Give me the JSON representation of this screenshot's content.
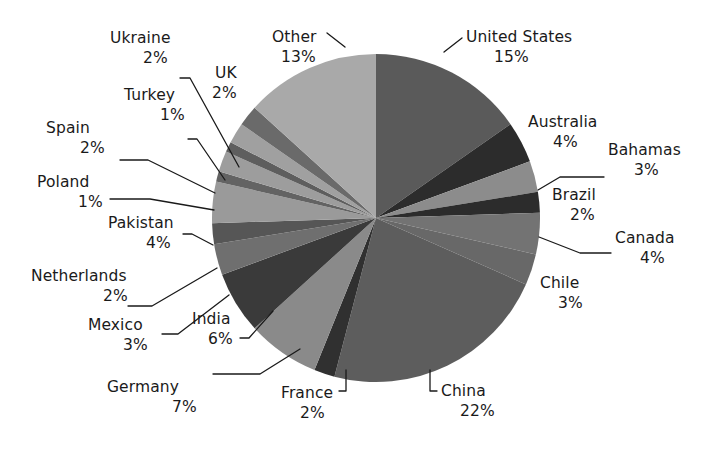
{
  "chart_data": {
    "type": "pie",
    "title": "",
    "subtitle": "",
    "xlabel": "",
    "ylabel": "",
    "legend_position": "labels-with-leader-lines",
    "grid": false,
    "value_unit": "%",
    "start_angle_deg": 0,
    "direction": "clockwise",
    "total_shown_percent": 98,
    "categories": [
      "United States",
      "Australia",
      "Bahamas",
      "Brazil",
      "Canada",
      "Chile",
      "China",
      "France",
      "Germany",
      "India",
      "Mexico",
      "Netherlands",
      "Pakistan",
      "Poland",
      "Spain",
      "Turkey",
      "Ukraine",
      "UK",
      "Other"
    ],
    "values": [
      15,
      4,
      3,
      2,
      4,
      3,
      22,
      2,
      7,
      6,
      3,
      2,
      4,
      1,
      2,
      1,
      2,
      2,
      13
    ],
    "slices": [
      {
        "label": "United States",
        "value": 15,
        "pct_text": "15%",
        "color": "#5a5a5a"
      },
      {
        "label": "Australia",
        "value": 4,
        "pct_text": "4%",
        "color": "#2c2c2c"
      },
      {
        "label": "Bahamas",
        "value": 3,
        "pct_text": "3%",
        "color": "#8c8c8c"
      },
      {
        "label": "Brazil",
        "value": 2,
        "pct_text": "2%",
        "color": "#2c2c2c"
      },
      {
        "label": "Canada",
        "value": 4,
        "pct_text": "4%",
        "color": "#737373"
      },
      {
        "label": "Chile",
        "value": 3,
        "pct_text": "3%",
        "color": "#686868"
      },
      {
        "label": "China",
        "value": 22,
        "pct_text": "22%",
        "color": "#5d5d5d"
      },
      {
        "label": "France",
        "value": 2,
        "pct_text": "2%",
        "color": "#303030"
      },
      {
        "label": "Germany",
        "value": 7,
        "pct_text": "7%",
        "color": "#8a8a8a"
      },
      {
        "label": "India",
        "value": 6,
        "pct_text": "6%",
        "color": "#3a3a3a"
      },
      {
        "label": "Mexico",
        "value": 3,
        "pct_text": "3%",
        "color": "#6f6f6f"
      },
      {
        "label": "Netherlands",
        "value": 2,
        "pct_text": "2%",
        "color": "#565656"
      },
      {
        "label": "Pakistan",
        "value": 4,
        "pct_text": "4%",
        "color": "#9a9a9a"
      },
      {
        "label": "Poland",
        "value": 1,
        "pct_text": "1%",
        "color": "#636363"
      },
      {
        "label": "Spain",
        "value": 2,
        "pct_text": "2%",
        "color": "#9d9d9d"
      },
      {
        "label": "Turkey",
        "value": 1,
        "pct_text": "1%",
        "color": "#5e5e5e"
      },
      {
        "label": "Ukraine",
        "value": 2,
        "pct_text": "2%",
        "color": "#a0a0a0"
      },
      {
        "label": "UK",
        "value": 2,
        "pct_text": "2%",
        "color": "#6a6a6a"
      },
      {
        "label": "Other",
        "value": 13,
        "pct_text": "13%",
        "color": "#a9a9a9"
      }
    ]
  },
  "geometry": {
    "cx": 376,
    "cy": 218,
    "r": 164
  },
  "labels": [
    {
      "name": "United States",
      "pct": "15%",
      "nx": 466,
      "ny": 42,
      "px": 494,
      "py": 62,
      "anchor": "start",
      "leader": "M 444 52 L 462 38"
    },
    {
      "name": "Australia",
      "pct": "4%",
      "nx": 528,
      "ny": 127,
      "px": 553,
      "py": 147,
      "anchor": "start",
      "leader": ""
    },
    {
      "name": "Bahamas",
      "pct": "3%",
      "nx": 608,
      "ny": 155,
      "px": 634,
      "py": 175,
      "anchor": "start",
      "leader": "M 538 190 L 560 177 L 604 177"
    },
    {
      "name": "Brazil",
      "pct": "2%",
      "nx": 552,
      "ny": 200,
      "px": 570,
      "py": 220,
      "anchor": "start",
      "leader": ""
    },
    {
      "name": "Canada",
      "pct": "4%",
      "nx": 615,
      "ny": 243,
      "px": 640,
      "py": 263,
      "anchor": "start",
      "leader": "M 539 237 L 580 253 L 611 253"
    },
    {
      "name": "Chile",
      "pct": "3%",
      "nx": 540,
      "ny": 288,
      "px": 558,
      "py": 308,
      "anchor": "start",
      "leader": ""
    },
    {
      "name": "China",
      "pct": "22%",
      "nx": 441,
      "ny": 396,
      "px": 460,
      "py": 416,
      "anchor": "start",
      "leader": "M 430 370 L 430 391 L 437 391"
    },
    {
      "name": "France",
      "pct": "2%",
      "nx": 281,
      "ny": 398,
      "px": 300,
      "py": 418,
      "anchor": "start",
      "leader": "M 346 370 L 346 391 L 339 391"
    },
    {
      "name": "Germany",
      "pct": "7%",
      "nx": 107,
      "ny": 392,
      "px": 172,
      "py": 412,
      "anchor": "start",
      "leader": "M 300 349 L 260 374 L 213 374"
    },
    {
      "name": "India",
      "pct": "6%",
      "nx": 192,
      "ny": 324,
      "px": 208,
      "py": 344,
      "anchor": "start",
      "leader": "M 273 311 L 249 338 L 240 338"
    },
    {
      "name": "Mexico",
      "pct": "3%",
      "nx": 88,
      "ny": 330,
      "px": 123,
      "py": 350,
      "anchor": "start",
      "leader": "M 229 295 L 178 334 L 162 334"
    },
    {
      "name": "Netherlands",
      "pct": "2%",
      "nx": 31,
      "ny": 281,
      "px": 103,
      "py": 301,
      "anchor": "start",
      "leader": "M 217 268 L 152 306 L 128 306"
    },
    {
      "name": "Pakistan",
      "pct": "4%",
      "nx": 108,
      "ny": 228,
      "px": 146,
      "py": 248,
      "anchor": "start",
      "leader": "M 213 245 L 192 234 L 183 234"
    },
    {
      "name": "Poland",
      "pct": "1%",
      "nx": 37,
      "ny": 187,
      "px": 78,
      "py": 207,
      "anchor": "start",
      "leader": "M 214 210 L 150 199 L 110 199"
    },
    {
      "name": "Spain",
      "pct": "2%",
      "nx": 46,
      "ny": 133,
      "px": 80,
      "py": 153,
      "anchor": "start",
      "leader": "M 215 193 L 148 160 L 120 160"
    },
    {
      "name": "Turkey",
      "pct": "1%",
      "nx": 124,
      "ny": 100,
      "px": 160,
      "py": 120,
      "anchor": "start",
      "leader": "M 225 180 L 197 139 L 188 139"
    },
    {
      "name": "Ukraine",
      "pct": "2%",
      "nx": 110,
      "ny": 43,
      "px": 143,
      "py": 63,
      "anchor": "start",
      "leader": "M 239 167 L 190 78 L 180 78"
    },
    {
      "name": "UK",
      "pct": "2%",
      "nx": 215,
      "ny": 78,
      "px": 212,
      "py": 98,
      "anchor": "start",
      "leader": ""
    },
    {
      "name": "Other",
      "pct": "13%",
      "nx": 272,
      "ny": 42,
      "px": 281,
      "py": 62,
      "anchor": "start",
      "leader": "M 345 47 L 327 33"
    }
  ]
}
